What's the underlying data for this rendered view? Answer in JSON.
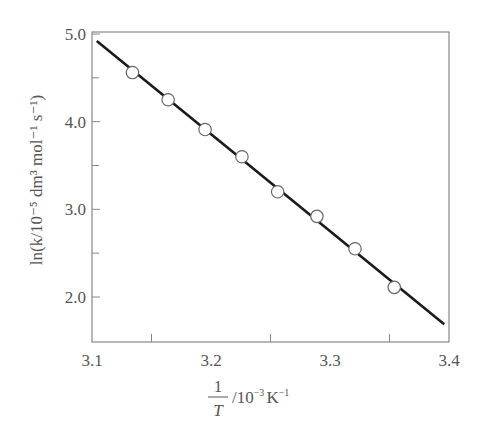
{
  "chart_data": {
    "type": "scatter",
    "title": "",
    "xlabel": "1/T / 10^-3 K^-1",
    "ylabel": "ln(k/10^-5 dm^3 mol^-1 s^-1)",
    "xlim": [
      3.1,
      3.4
    ],
    "ylim": [
      1.5,
      5.0
    ],
    "grid": false,
    "legend": null,
    "x_ticks": [
      3.1,
      3.2,
      3.3,
      3.4
    ],
    "x_tick_labels": [
      "3.1",
      "3.2",
      "3.3",
      "3.4"
    ],
    "x_minor_ticks": [
      3.15,
      3.25,
      3.35
    ],
    "y_ticks": [
      2.0,
      3.0,
      4.0,
      5.0
    ],
    "y_tick_labels": [
      "2.0",
      "3.0",
      "4.0",
      "5.0"
    ],
    "y_minor_ticks": [
      2.5,
      3.5,
      4.5
    ],
    "series": [
      {
        "name": "data",
        "marker": "open-circle",
        "x": [
          3.134,
          3.164,
          3.195,
          3.226,
          3.256,
          3.289,
          3.321,
          3.354
        ],
        "y": [
          4.56,
          4.25,
          3.91,
          3.6,
          3.2,
          2.92,
          2.55,
          2.11
        ]
      },
      {
        "name": "fit",
        "style": "line",
        "x": [
          3.104,
          3.396
        ],
        "y": [
          4.92,
          1.69
        ]
      }
    ]
  },
  "labels": {
    "x_numerator": "1",
    "x_denominator": "T",
    "x_unit_prefix": "/10",
    "x_unit_exp": "−3",
    "x_unit_K": "K",
    "x_unit_K_exp": "−1",
    "y_label": "ln(k/10⁻⁵ dm³ mol⁻¹ s⁻¹)"
  }
}
